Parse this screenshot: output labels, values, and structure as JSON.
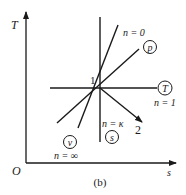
{
  "figure": {
    "caption": "(b)",
    "axes": {
      "y_label": "T",
      "x_label": "s",
      "origin_label": "O"
    },
    "state_point": {
      "label": "1"
    },
    "end_point": {
      "label": "2"
    },
    "processes": [
      {
        "name": "isobaric",
        "circle_label": "p",
        "n_label": "n = 0"
      },
      {
        "name": "isothermal",
        "circle_label": "T",
        "n_label": "n = 1"
      },
      {
        "name": "isentropic",
        "circle_label": "s",
        "n_label": "n = κ"
      },
      {
        "name": "isochoric",
        "circle_label": "v",
        "n_label": "n = ∞"
      }
    ],
    "line_color": "#1a1a1a",
    "background": "#ffffff"
  }
}
